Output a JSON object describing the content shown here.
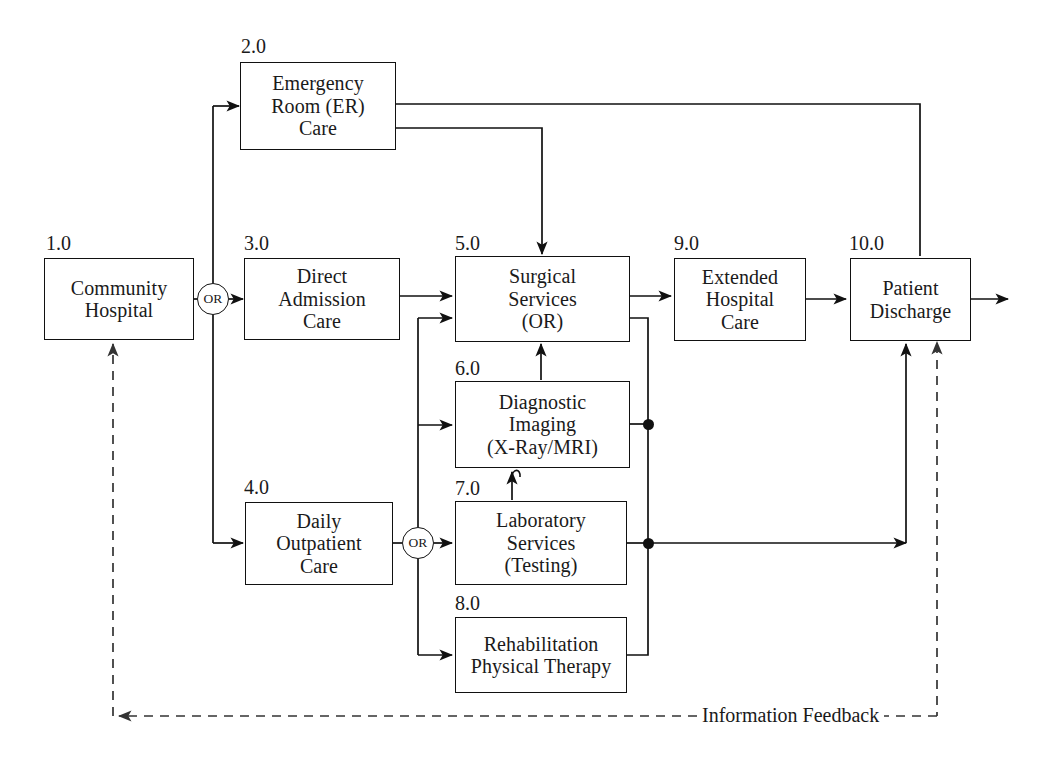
{
  "diagram": {
    "stroke_color": "#111111",
    "background_color": "#ffffff",
    "processes": [
      {
        "id": "1.0",
        "name": "community-hospital",
        "lines": [
          "Community",
          "Hospital"
        ]
      },
      {
        "id": "2.0",
        "name": "emergency-room-care",
        "lines": [
          "Emergency",
          "Room (ER)",
          "Care"
        ]
      },
      {
        "id": "3.0",
        "name": "direct-admission-care",
        "lines": [
          "Direct",
          "Admission",
          "Care"
        ]
      },
      {
        "id": "4.0",
        "name": "daily-outpatient-care",
        "lines": [
          "Daily",
          "Outpatient",
          "Care"
        ]
      },
      {
        "id": "5.0",
        "name": "surgical-services",
        "lines": [
          "Surgical",
          "Services",
          "(OR)"
        ]
      },
      {
        "id": "6.0",
        "name": "diagnostic-imaging",
        "lines": [
          "Diagnostic",
          "Imaging",
          "(X-Ray/MRI)"
        ]
      },
      {
        "id": "7.0",
        "name": "laboratory-services",
        "lines": [
          "Laboratory",
          "Services",
          "(Testing)"
        ]
      },
      {
        "id": "8.0",
        "name": "rehabilitation-physical-therapy",
        "lines": [
          "Rehabilitation",
          "Physical Therapy"
        ]
      },
      {
        "id": "9.0",
        "name": "extended-hospital-care",
        "lines": [
          "Extended",
          "Hospital",
          "Care"
        ]
      },
      {
        "id": "10.0",
        "name": "patient-discharge",
        "lines": [
          "Patient",
          "Discharge"
        ]
      }
    ],
    "or_gates": [
      {
        "name": "or-gate-intake",
        "label": "OR"
      },
      {
        "name": "or-gate-ancillary",
        "label": "OR"
      }
    ],
    "feedback": {
      "label": "Information Feedback",
      "style": "dashed"
    }
  }
}
